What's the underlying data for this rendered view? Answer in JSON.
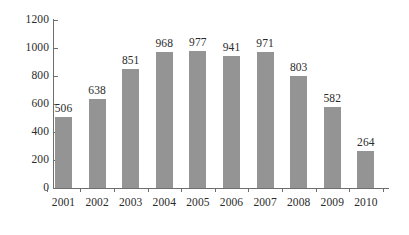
{
  "chart_data": {
    "type": "bar",
    "title": "",
    "subtitle": "",
    "xlabel": "",
    "ylabel": "",
    "categories": [
      "2001",
      "2002",
      "2003",
      "2004",
      "2005",
      "2006",
      "2007",
      "2008",
      "2009",
      "2010"
    ],
    "values": [
      506,
      638,
      851,
      968,
      977,
      941,
      971,
      803,
      582,
      264
    ],
    "series": [
      {
        "name": "",
        "values": [
          506,
          638,
          851,
          968,
          977,
          941,
          971,
          803,
          582,
          264
        ]
      }
    ],
    "ylim": [
      0,
      1200
    ],
    "ytick_values": [
      0,
      200,
      400,
      600,
      800,
      1000,
      1200
    ],
    "ytick_labels": [
      "0",
      "200",
      "400",
      "600",
      "800",
      "1000",
      "1200"
    ],
    "grid": false,
    "legend": false,
    "legend_position": "none",
    "data_labels": true,
    "bar_color": "#949494",
    "axis_color": "#6e6e6e",
    "text_color": "#2b2b2b",
    "background_color": "#ffffff"
  }
}
